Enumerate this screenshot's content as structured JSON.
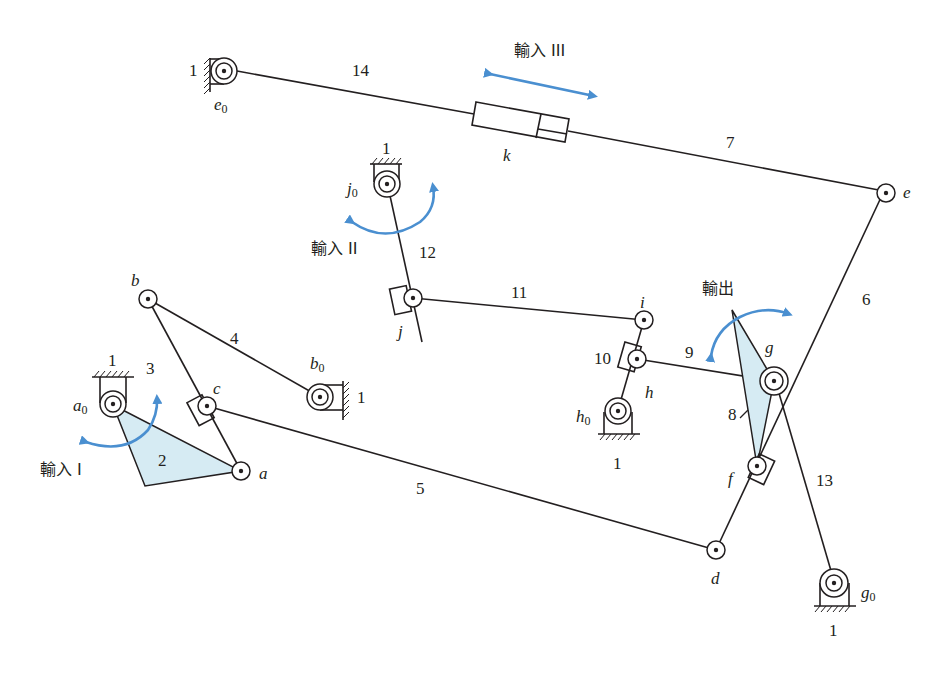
{
  "diagram": {
    "type": "planar-linkage-mechanism",
    "accent_color": "#4a8fd0",
    "fill_color": "#d6ebf3",
    "inputs": {
      "input1": "輸入 I",
      "input2": "輸入 II",
      "input3": "輸入 III",
      "output": "輸出"
    },
    "link_numbers": {
      "l1_e0": "1",
      "l1_j0": "1",
      "l1_a0": "1",
      "l1_b0": "1",
      "l1_h0": "1",
      "l1_g0": "1",
      "l2": "2",
      "l3": "3",
      "l4": "4",
      "l5": "5",
      "l6": "6",
      "l7": "7",
      "l8": "8",
      "l9": "9",
      "l10": "10",
      "l11": "11",
      "l12": "12",
      "l13": "13",
      "l14": "14"
    },
    "joints": {
      "a0": {
        "base": "a",
        "sub": "0"
      },
      "b0": {
        "base": "b",
        "sub": "0"
      },
      "e0": {
        "base": "e",
        "sub": "0"
      },
      "j0": {
        "base": "j",
        "sub": "0"
      },
      "h0": {
        "base": "h",
        "sub": "0"
      },
      "g0": {
        "base": "g",
        "sub": "0"
      },
      "a": "a",
      "b": "b",
      "c": "c",
      "d": "d",
      "e": "e",
      "f": "f",
      "g": "g",
      "h": "h",
      "i": "i",
      "j": "j",
      "k": "k"
    }
  }
}
